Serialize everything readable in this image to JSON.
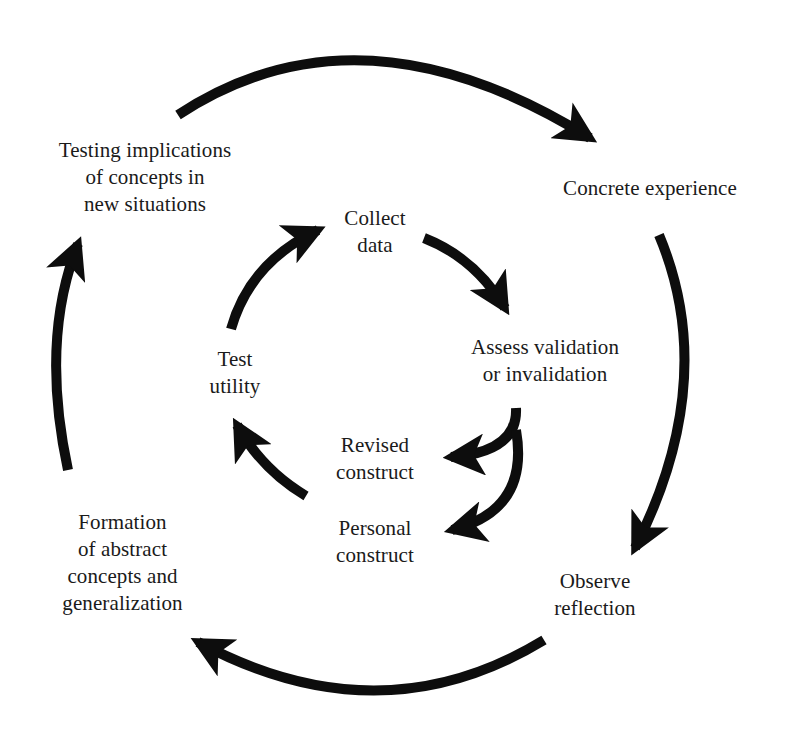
{
  "diagram": {
    "type": "cycle",
    "outer_cycle": {
      "nodes": [
        {
          "id": "concrete",
          "lines": [
            "Concrete experience"
          ]
        },
        {
          "id": "observe",
          "lines": [
            "Observe",
            "reflection"
          ]
        },
        {
          "id": "formation",
          "lines": [
            "Formation",
            "of abstract",
            "concepts and",
            "generalization"
          ]
        },
        {
          "id": "testing",
          "lines": [
            "Testing implications",
            "of concepts in",
            "new situations"
          ]
        }
      ],
      "edges": [
        {
          "from": "testing",
          "to": "concrete"
        },
        {
          "from": "concrete",
          "to": "observe"
        },
        {
          "from": "observe",
          "to": "formation"
        },
        {
          "from": "formation",
          "to": "testing"
        }
      ]
    },
    "inner_cycle": {
      "nodes": [
        {
          "id": "collect",
          "lines": [
            "Collect",
            "data"
          ]
        },
        {
          "id": "assess",
          "lines": [
            "Assess validation",
            "or invalidation"
          ]
        },
        {
          "id": "revised",
          "lines": [
            "Revised",
            "construct"
          ]
        },
        {
          "id": "personal",
          "lines": [
            "Personal",
            "construct"
          ]
        },
        {
          "id": "test",
          "lines": [
            "Test",
            "utility"
          ]
        }
      ],
      "edges": [
        {
          "from": "collect",
          "to": "assess"
        },
        {
          "from": "assess",
          "to": "revised"
        },
        {
          "from": "assess",
          "to": "personal"
        },
        {
          "from": "revised",
          "to": "test"
        },
        {
          "from": "test",
          "to": "collect"
        }
      ]
    },
    "colors": {
      "arrow": "#0d0d0d",
      "text": "#1a1a1a",
      "background": "#ffffff"
    }
  }
}
